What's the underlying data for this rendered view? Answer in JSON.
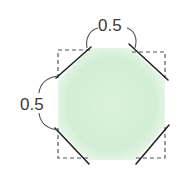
{
  "diagram": {
    "labels": {
      "top": "0.5",
      "left": "0.5"
    },
    "colors": {
      "fill": "#cdeccf",
      "outline_dashed": "#555555",
      "cut_lines": "#222222",
      "text": "#3a3a3a"
    }
  }
}
